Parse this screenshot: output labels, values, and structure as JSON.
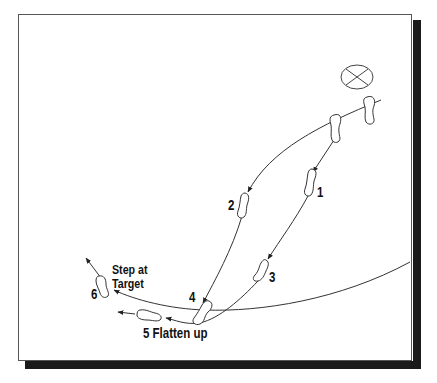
{
  "diagram": {
    "target_icon": "target-circle-x",
    "steps": [
      {
        "number": "1",
        "label": "1"
      },
      {
        "number": "2",
        "label": "2"
      },
      {
        "number": "3",
        "label": "3"
      },
      {
        "number": "4",
        "label": "4"
      },
      {
        "number": "5",
        "label": "5 Flatten up"
      },
      {
        "number": "6",
        "label": "6"
      }
    ],
    "annotations": {
      "step_at_line1": "Step at",
      "step_at_line2": "Target"
    },
    "colors": {
      "line": "#333333",
      "shadow": "#1a1a1a",
      "frame": "#555555"
    }
  }
}
